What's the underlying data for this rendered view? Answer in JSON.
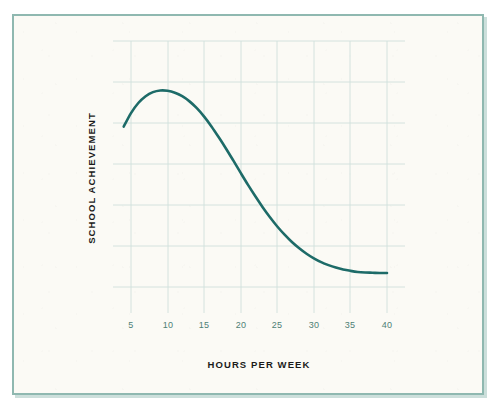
{
  "figure": {
    "background_color": "#fbfaf5",
    "frame_color": "#8fb8b0",
    "page_color": "#ffffff"
  },
  "chart_data": {
    "type": "line",
    "title": "",
    "subtitle": "",
    "xlabel": "HOURS PER WEEK",
    "ylabel": "SCHOOL ACHIEVEMENT",
    "xlim": [
      3,
      42
    ],
    "ylim": [
      0,
      10
    ],
    "xticks": [
      5,
      10,
      15,
      20,
      25,
      30,
      35,
      40
    ],
    "xticklabels": [
      "5",
      "10",
      "15",
      "20",
      "25",
      "30",
      "35",
      "40"
    ],
    "yticks": [],
    "yticklabels": [],
    "grid": true,
    "grid_color": "#cfe0dc",
    "legend": "none",
    "annotations": [],
    "series": [
      {
        "name": "school achievement vs hours per week",
        "color": "#1d6b68",
        "line_width": 2.6,
        "markers": false,
        "x": [
          4.0,
          5.0,
          6.0,
          7.0,
          8.0,
          9.0,
          10.0,
          11.0,
          12.0,
          13.0,
          14.0,
          15.0,
          16.0,
          17.0,
          18.0,
          19.0,
          20.0,
          21.0,
          22.0,
          23.0,
          24.0,
          25.0,
          26.0,
          27.0,
          28.0,
          29.0,
          30.0,
          31.0,
          32.0,
          33.0,
          34.0,
          35.0,
          36.0,
          37.0,
          38.0,
          39.0,
          40.0
        ],
        "y": [
          6.85,
          7.35,
          7.72,
          7.97,
          8.12,
          8.18,
          8.17,
          8.1,
          7.97,
          7.78,
          7.53,
          7.22,
          6.86,
          6.46,
          6.04,
          5.6,
          5.15,
          4.71,
          4.29,
          3.89,
          3.52,
          3.18,
          2.88,
          2.61,
          2.38,
          2.18,
          2.01,
          1.87,
          1.76,
          1.67,
          1.6,
          1.55,
          1.51,
          1.49,
          1.48,
          1.47,
          1.47
        ]
      }
    ]
  },
  "axes": {
    "x_axis_title": "HOURS PER WEEK",
    "y_axis_title": "SCHOOL ACHIEVEMENT",
    "tick_labels_x": [
      "5",
      "10",
      "15",
      "20",
      "25",
      "30",
      "35",
      "40"
    ]
  }
}
